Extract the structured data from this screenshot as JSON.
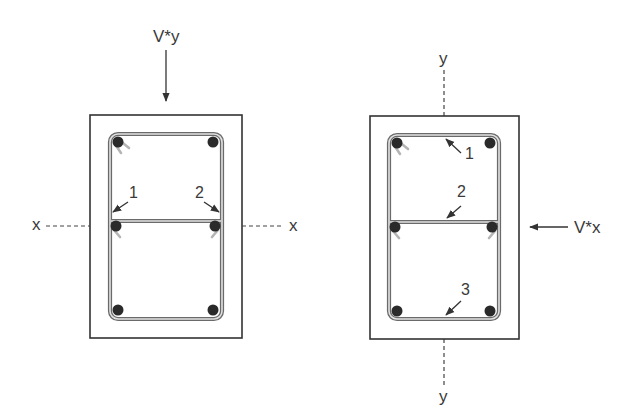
{
  "diagram": {
    "left_section": {
      "load_label": "V*y",
      "axis_label_left": "x",
      "axis_label_right": "x",
      "callouts": [
        "1",
        "2"
      ]
    },
    "right_section": {
      "load_label": "V*x",
      "axis_label_top": "y",
      "axis_label_bottom": "y",
      "callouts": [
        "1",
        "2",
        "3"
      ]
    },
    "colors": {
      "line": "#333333",
      "stirrup_outer": "#6a6a6a",
      "stirrup_fill": "#d8d8d8",
      "bar": "#2a2a2a",
      "hook": "#b5b5b5"
    }
  }
}
